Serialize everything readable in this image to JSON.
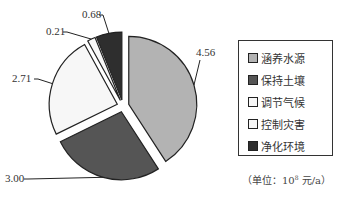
{
  "chart_data": {
    "type": "pie",
    "title": "",
    "style": "exploded",
    "start_angle_deg": 0,
    "direction": "clockwise",
    "categories": [
      "涵养水源",
      "保持土壤",
      "调节气候",
      "控制灾害",
      "净化环境"
    ],
    "values": [
      4.56,
      3.0,
      2.71,
      0.21,
      0.68
    ],
    "value_labels": [
      "4.56",
      "3.00",
      "2.71",
      "0.21",
      "0.68"
    ],
    "colors": [
      "#b3b3b3",
      "#555555",
      "#f7f7f7",
      "#f7f7f7",
      "#2e2e2e"
    ],
    "legend_position": "right",
    "unit": "（单位：10⁸ 元/a）"
  },
  "legend": {
    "items": [
      {
        "label": "涵养水源",
        "color": "#b3b3b3"
      },
      {
        "label": "保持土壤",
        "color": "#555555"
      },
      {
        "label": "调节气候",
        "color": "#f7f7f7"
      },
      {
        "label": "控制灾害",
        "color": "#f7f7f7"
      },
      {
        "label": "净化环境",
        "color": "#2e2e2e"
      }
    ]
  },
  "unit_label": {
    "prefix": "（单位：10",
    "exponent": "8",
    "suffix": " 元/a）"
  }
}
